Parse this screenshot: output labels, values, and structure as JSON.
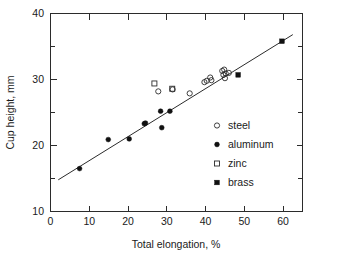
{
  "chart_data": {
    "type": "scatter",
    "title": "",
    "xlabel": "Total elongation, %",
    "ylabel": "Cup height, mm",
    "xlim": [
      0,
      65
    ],
    "ylim": [
      10,
      40
    ],
    "xticks": [
      0,
      10,
      20,
      30,
      40,
      50,
      60
    ],
    "yticks": [
      10,
      20,
      30,
      40
    ],
    "yminorticks": [
      15,
      25,
      35
    ],
    "grid": false,
    "legend_position": "center-right",
    "legend": [
      {
        "label": "steel",
        "marker": "open-circle"
      },
      {
        "label": "aluminum",
        "marker": "filled-circle"
      },
      {
        "label": "zinc",
        "marker": "open-square"
      },
      {
        "label": "brass",
        "marker": "filled-square"
      }
    ],
    "series": [
      {
        "name": "steel",
        "marker": "open-circle",
        "points": [
          [
            27.8,
            28.2
          ],
          [
            31.5,
            28.5
          ],
          [
            35.9,
            27.9
          ],
          [
            39.7,
            29.6
          ],
          [
            40.3,
            29.8
          ],
          [
            41.2,
            30.3
          ],
          [
            41.5,
            29.9
          ],
          [
            44.3,
            31.3
          ],
          [
            44.6,
            30.7
          ],
          [
            44.8,
            31.5
          ],
          [
            45.0,
            30.2
          ],
          [
            45.2,
            30.9
          ],
          [
            46.0,
            31.0
          ]
        ]
      },
      {
        "name": "aluminum",
        "marker": "filled-circle",
        "points": [
          [
            7.5,
            16.5
          ],
          [
            14.9,
            20.9
          ],
          [
            20.3,
            21.0
          ],
          [
            24.2,
            23.3
          ],
          [
            24.5,
            23.4
          ],
          [
            28.4,
            25.2
          ],
          [
            28.7,
            22.7
          ],
          [
            30.8,
            25.2
          ]
        ]
      },
      {
        "name": "zinc",
        "marker": "open-square",
        "points": [
          [
            26.8,
            29.4
          ],
          [
            31.4,
            28.6
          ]
        ]
      },
      {
        "name": "brass",
        "marker": "filled-square",
        "points": [
          [
            48.4,
            30.7
          ],
          [
            59.7,
            35.8
          ]
        ]
      }
    ],
    "trend_line": {
      "label": "linear fit",
      "x_start": 2.0,
      "y_start": 14.8,
      "x_end": 62.5,
      "y_end": 36.8
    }
  }
}
